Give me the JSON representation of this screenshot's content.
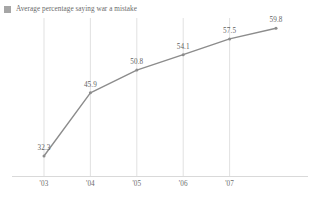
{
  "legend": {
    "swatch_color": "#a6a6a6",
    "label": "Average percentage saying war a mistake"
  },
  "chart_data": {
    "type": "line",
    "title": "",
    "subtitle": "",
    "xlabel": "",
    "ylabel": "",
    "grid": "vertical",
    "legend_position": "top-left",
    "series_color": "#8c8c8c",
    "categories": [
      "'03",
      "'04",
      "'05",
      "'06",
      "'07",
      ""
    ],
    "tick_labels": [
      "'03",
      "'04",
      "'05",
      "'06",
      "'07"
    ],
    "values": [
      32.3,
      45.9,
      50.8,
      54.1,
      57.5,
      59.8
    ],
    "point_labels": [
      "32.3",
      "45.9",
      "50.8",
      "54.1",
      "57.5",
      "59.8"
    ],
    "series": [
      {
        "name": "Average percentage saying war a mistake",
        "values": [
          32.3,
          45.9,
          50.8,
          54.1,
          57.5,
          59.8
        ]
      }
    ],
    "ylim": [
      28,
      62
    ],
    "xlim": [
      0,
      5
    ]
  }
}
